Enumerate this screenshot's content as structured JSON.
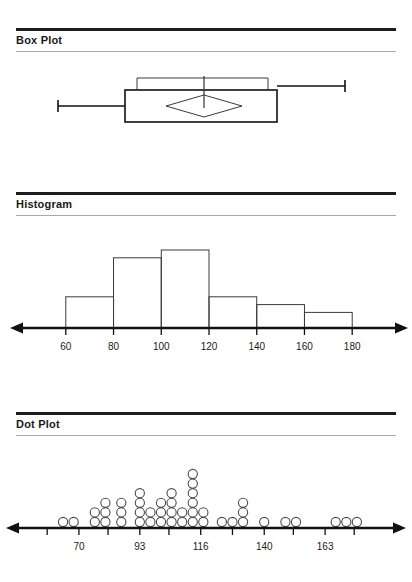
{
  "sections": [
    {
      "id": "box-plot",
      "title": "Box Plot"
    },
    {
      "id": "histogram",
      "title": "Histogram"
    },
    {
      "id": "dot-plot",
      "title": "Dot Plot"
    }
  ],
  "colors": {
    "ink": "#1a1a1a",
    "rule_top": "#1d1d1d",
    "rule_bottom": "#a8a8a8",
    "outline": "#3a3a3a",
    "axis": "#111111",
    "background": "#ffffff"
  },
  "chart_data": [
    {
      "type": "box",
      "title": "Box Plot",
      "orientation": "horizontal",
      "xlabel": "",
      "ylabel": "",
      "grid": false,
      "axis_shown": false,
      "tick_labels": [],
      "box": {
        "whisker_low": 58,
        "q1": 125,
        "median": 204,
        "q3": 277,
        "whisker_high": 345,
        "mean": 204,
        "mean_marker": "diamond",
        "mean_diamond_half_width": 38,
        "confidence_bracket": {
          "low": 137,
          "high": 268
        }
      },
      "note": "Values are horizontal pixel positions; no numeric axis is drawn on this panel."
    },
    {
      "type": "bar",
      "subtype": "histogram",
      "title": "Histogram",
      "xlabel": "",
      "ylabel": "",
      "grid": false,
      "bin_edges": [
        60,
        80,
        100,
        120,
        140,
        160,
        180
      ],
      "categories": [
        "60-80",
        "80-100",
        "100-120",
        "120-140",
        "140-160",
        "160-180"
      ],
      "values": [
        4,
        9,
        10,
        4,
        3,
        2
      ],
      "ylim": [
        0,
        10
      ],
      "tick_labels": [
        "60",
        "80",
        "100",
        "120",
        "140",
        "160",
        "180"
      ],
      "tick_values": [
        60,
        80,
        100,
        120,
        140,
        160,
        180
      ],
      "xlim": [
        45,
        195
      ],
      "axis_arrows": "both"
    },
    {
      "type": "scatter",
      "subtype": "dot-plot",
      "title": "Dot Plot",
      "xlabel": "",
      "ylabel": "",
      "grid": false,
      "tick_labels": [
        "70",
        "93",
        "116",
        "140",
        "163"
      ],
      "tick_values": [
        70,
        93,
        116,
        140,
        163
      ],
      "minor_tick_values": [
        58,
        81,
        104,
        128,
        151,
        174
      ],
      "xlim": [
        50,
        186
      ],
      "axis_arrows": "both",
      "stacks": [
        {
          "x": 64,
          "count": 1
        },
        {
          "x": 68,
          "count": 1
        },
        {
          "x": 76,
          "count": 2
        },
        {
          "x": 80,
          "count": 3
        },
        {
          "x": 86,
          "count": 3
        },
        {
          "x": 93,
          "count": 4
        },
        {
          "x": 97,
          "count": 2
        },
        {
          "x": 101,
          "count": 3
        },
        {
          "x": 105,
          "count": 4
        },
        {
          "x": 109,
          "count": 2
        },
        {
          "x": 113,
          "count": 6
        },
        {
          "x": 117,
          "count": 2
        },
        {
          "x": 124,
          "count": 1
        },
        {
          "x": 128,
          "count": 1
        },
        {
          "x": 132,
          "count": 3
        },
        {
          "x": 140,
          "count": 1
        },
        {
          "x": 148,
          "count": 1
        },
        {
          "x": 152,
          "count": 1
        },
        {
          "x": 167,
          "count": 1
        },
        {
          "x": 171,
          "count": 1
        },
        {
          "x": 175,
          "count": 1
        }
      ],
      "total_points": 44,
      "marker": "open-circle"
    }
  ]
}
